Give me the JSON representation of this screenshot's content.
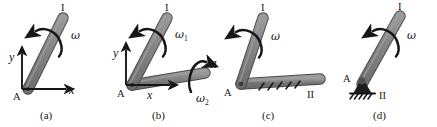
{
  "figure": {
    "title": "",
    "background_color": "#ffffff",
    "rod_fill": "#808080",
    "rod_edge": "#4a4a4a",
    "ink_color": "#161616",
    "panel_count": 4
  },
  "panels": [
    {
      "id": "a",
      "caption": "(a)",
      "joint_label": "A",
      "bodies": [
        {
          "name": "rod-I",
          "label": "I"
        }
      ],
      "rotation_labels": [
        {
          "name": "omega",
          "text": "ω",
          "subscript": ""
        }
      ],
      "axes": {
        "x_label": "x",
        "y_label": "y",
        "origin_label": "A"
      },
      "support": "none",
      "hatching": false
    },
    {
      "id": "b",
      "caption": "(b)",
      "joint_label": "A",
      "bodies": [
        {
          "name": "rod-I",
          "label": "I"
        },
        {
          "name": "rod-II",
          "label": "II"
        }
      ],
      "rotation_labels": [
        {
          "name": "omega-1",
          "text": "ω",
          "subscript": "1"
        },
        {
          "name": "omega-2",
          "text": "ω",
          "subscript": "2"
        }
      ],
      "axes": {
        "x_label": "x",
        "y_label": "y",
        "origin_label": "A"
      },
      "support": "none",
      "hatching": false
    },
    {
      "id": "c",
      "caption": "(c)",
      "joint_label": "A",
      "bodies": [
        {
          "name": "rod-I",
          "label": "I"
        },
        {
          "name": "rod-II",
          "label": "II"
        }
      ],
      "rotation_labels": [
        {
          "name": "omega",
          "text": "ω",
          "subscript": ""
        }
      ],
      "axes": null,
      "support": "fixed-hatched-bar",
      "hatching": true
    },
    {
      "id": "d",
      "caption": "(d)",
      "joint_label": "A",
      "bodies": [
        {
          "name": "rod-I",
          "label": "I"
        },
        {
          "name": "ground-II",
          "label": "II"
        }
      ],
      "rotation_labels": [
        {
          "name": "omega",
          "text": "ω",
          "subscript": ""
        }
      ],
      "axes": null,
      "support": "pin-support-on-ground",
      "hatching": true
    }
  ],
  "labels": {
    "rod_one": "I",
    "rod_two": "II",
    "joint": "A",
    "omega": "ω",
    "omega_sub1": "1",
    "omega_sub2": "2",
    "axis_x": "x",
    "axis_y": "y",
    "caption_a": "(a)",
    "caption_b": "(b)",
    "caption_c": "(c)",
    "caption_d": "(d)"
  }
}
